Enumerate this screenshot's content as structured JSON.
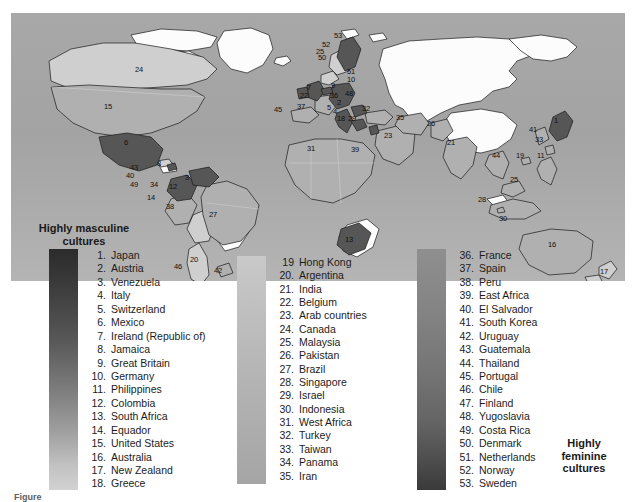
{
  "figure": {
    "type": "choropleth-world-map",
    "caption_label": "Figure",
    "caption_number": "",
    "caption_text": ""
  },
  "legend": {
    "masculine_title_line1": "Highly masculine",
    "masculine_title_line2": "cultures",
    "feminine_title_line1": "Highly",
    "feminine_title_line2": "feminine",
    "feminine_title_line3": "cultures",
    "scale_bars": [
      {
        "name": "bar-masculine-dark",
        "from_color": "#2b2b2b",
        "to_color": "#d2d2d2"
      },
      {
        "name": "bar-middle-gray",
        "from_color": "#c9c9c9",
        "to_color": "#a5a5a5"
      },
      {
        "name": "bar-feminine-dark",
        "from_color": "#8f8f8f",
        "to_color": "#3a3a3a"
      }
    ],
    "column_1": [
      {
        "num": "1.",
        "name": "Japan"
      },
      {
        "num": "2.",
        "name": "Austria"
      },
      {
        "num": "3.",
        "name": "Venezuela"
      },
      {
        "num": "4.",
        "name": "Italy"
      },
      {
        "num": "5.",
        "name": "Switzerland"
      },
      {
        "num": "6.",
        "name": "Mexico"
      },
      {
        "num": "7.",
        "name": "Ireland (Republic of)"
      },
      {
        "num": "8.",
        "name": "Jamaica"
      },
      {
        "num": "9.",
        "name": "Great Britain"
      },
      {
        "num": "10.",
        "name": "Germany"
      },
      {
        "num": "11.",
        "name": "Philippines"
      },
      {
        "num": "12.",
        "name": "Colombia"
      },
      {
        "num": "13.",
        "name": "South Africa"
      },
      {
        "num": "14.",
        "name": "Equador"
      },
      {
        "num": "15.",
        "name": "United States"
      },
      {
        "num": "16.",
        "name": "Australia"
      },
      {
        "num": "17.",
        "name": "New Zealand"
      },
      {
        "num": "18.",
        "name": "Greece"
      }
    ],
    "column_2": [
      {
        "num": "19",
        "name": "Hong Kong"
      },
      {
        "num": "20.",
        "name": "Argentina"
      },
      {
        "num": "21.",
        "name": "India"
      },
      {
        "num": "22.",
        "name": "Belgium"
      },
      {
        "num": "23.",
        "name": "Arab countries"
      },
      {
        "num": "24.",
        "name": "Canada"
      },
      {
        "num": "25.",
        "name": "Malaysia"
      },
      {
        "num": "26.",
        "name": "Pakistan"
      },
      {
        "num": "27.",
        "name": "Brazil"
      },
      {
        "num": "28.",
        "name": "Singapore"
      },
      {
        "num": "29.",
        "name": "Israel"
      },
      {
        "num": "30.",
        "name": "Indonesia"
      },
      {
        "num": "31.",
        "name": "West Africa"
      },
      {
        "num": "32.",
        "name": "Turkey"
      },
      {
        "num": "33.",
        "name": "Taiwan"
      },
      {
        "num": "34.",
        "name": "Panama"
      },
      {
        "num": "35.",
        "name": "Iran"
      }
    ],
    "column_3": [
      {
        "num": "36.",
        "name": "France"
      },
      {
        "num": "37.",
        "name": "Spain"
      },
      {
        "num": "38.",
        "name": "Peru"
      },
      {
        "num": "39.",
        "name": "East Africa"
      },
      {
        "num": "40.",
        "name": "El Salvador"
      },
      {
        "num": "41.",
        "name": "South Korea"
      },
      {
        "num": "42.",
        "name": "Uruguay"
      },
      {
        "num": "43.",
        "name": "Guatemala"
      },
      {
        "num": "44.",
        "name": "Thailand"
      },
      {
        "num": "45.",
        "name": "Portugal"
      },
      {
        "num": "46.",
        "name": "Chile"
      },
      {
        "num": "47.",
        "name": "Finland"
      },
      {
        "num": "48.",
        "name": "Yugoslavia"
      },
      {
        "num": "49.",
        "name": "Costa Rica"
      },
      {
        "num": "50.",
        "name": "Denmark"
      },
      {
        "num": "51.",
        "name": "Netherlands"
      },
      {
        "num": "52.",
        "name": "Norway"
      },
      {
        "num": "53.",
        "name": "Sweden"
      }
    ]
  },
  "map_labels": [
    {
      "num": "53",
      "x": 334,
      "y": 32
    },
    {
      "num": "52",
      "x": 322,
      "y": 41
    },
    {
      "num": "25",
      "x": 316,
      "y": 48
    },
    {
      "num": "50",
      "x": 318,
      "y": 54
    },
    {
      "num": "51",
      "x": 347,
      "y": 68
    },
    {
      "num": "10",
      "x": 347,
      "y": 76
    },
    {
      "num": "7",
      "x": 307,
      "y": 84
    },
    {
      "num": "9",
      "x": 331,
      "y": 82
    },
    {
      "num": "22",
      "x": 300,
      "y": 92
    },
    {
      "num": "36",
      "x": 330,
      "y": 92
    },
    {
      "num": "48",
      "x": 345,
      "y": 90
    },
    {
      "num": "2",
      "x": 337,
      "y": 99
    },
    {
      "num": "5",
      "x": 327,
      "y": 104
    },
    {
      "num": "4",
      "x": 333,
      "y": 108
    },
    {
      "num": "45",
      "x": 274,
      "y": 106
    },
    {
      "num": "37",
      "x": 297,
      "y": 103
    },
    {
      "num": "18",
      "x": 337,
      "y": 115
    },
    {
      "num": "29",
      "x": 348,
      "y": 115
    },
    {
      "num": "32",
      "x": 362,
      "y": 105
    },
    {
      "num": "35",
      "x": 396,
      "y": 114
    },
    {
      "num": "26",
      "x": 427,
      "y": 120
    },
    {
      "num": "23",
      "x": 384,
      "y": 132
    },
    {
      "num": "21",
      "x": 447,
      "y": 139
    },
    {
      "num": "31",
      "x": 307,
      "y": 145
    },
    {
      "num": "39",
      "x": 351,
      "y": 146
    },
    {
      "num": "13",
      "x": 345,
      "y": 236
    },
    {
      "num": "24",
      "x": 135,
      "y": 66
    },
    {
      "num": "15",
      "x": 104,
      "y": 103
    },
    {
      "num": "6",
      "x": 124,
      "y": 139
    },
    {
      "num": "8",
      "x": 157,
      "y": 160
    },
    {
      "num": "43",
      "x": 130,
      "y": 164
    },
    {
      "num": "40",
      "x": 126,
      "y": 172
    },
    {
      "num": "49",
      "x": 130,
      "y": 181
    },
    {
      "num": "34",
      "x": 150,
      "y": 181
    },
    {
      "num": "3",
      "x": 185,
      "y": 174
    },
    {
      "num": "12",
      "x": 169,
      "y": 183
    },
    {
      "num": "14",
      "x": 147,
      "y": 194
    },
    {
      "num": "38",
      "x": 166,
      "y": 203
    },
    {
      "num": "27",
      "x": 209,
      "y": 211
    },
    {
      "num": "46",
      "x": 174,
      "y": 263
    },
    {
      "num": "20",
      "x": 190,
      "y": 256
    },
    {
      "num": "42",
      "x": 214,
      "y": 267
    },
    {
      "num": "1",
      "x": 554,
      "y": 117
    },
    {
      "num": "41",
      "x": 529,
      "y": 126
    },
    {
      "num": "33",
      "x": 535,
      "y": 136
    },
    {
      "num": "19",
      "x": 516,
      "y": 152
    },
    {
      "num": "11",
      "x": 537,
      "y": 152
    },
    {
      "num": "44",
      "x": 492,
      "y": 152
    },
    {
      "num": "25",
      "x": 510,
      "y": 176
    },
    {
      "num": "28",
      "x": 478,
      "y": 196
    },
    {
      "num": "30",
      "x": 499,
      "y": 215
    },
    {
      "num": "16",
      "x": 548,
      "y": 241
    },
    {
      "num": "17",
      "x": 600,
      "y": 268
    }
  ]
}
